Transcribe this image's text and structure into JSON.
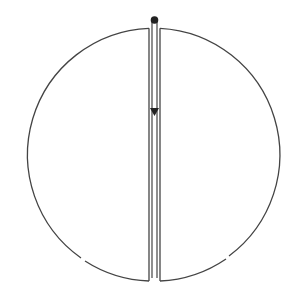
{
  "diagram": {
    "type": "split-circle-with-channel",
    "colors": {
      "stroke": "#444444",
      "background": "#ffffff",
      "dot": "#222222"
    },
    "circle": {
      "cx": 154.5,
      "cy": 154.5,
      "r": 126.5
    },
    "channel": {
      "x_left": 149,
      "x_right": 160,
      "inner_left": 151.5,
      "inner_right": 157.5
    },
    "gaps": [
      "lower-left",
      "lower-right"
    ],
    "arrow": {
      "direction": "down",
      "start_y": 22,
      "end_y": 115
    }
  }
}
